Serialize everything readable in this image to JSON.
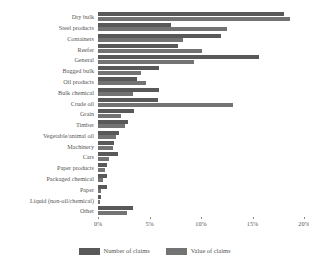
{
  "chart_data": {
    "type": "bar",
    "orientation": "horizontal",
    "title": "",
    "xlabel": "",
    "ylabel": "",
    "xlim": [
      0,
      20
    ],
    "xticks": [
      0,
      5,
      10,
      15,
      20
    ],
    "xtick_labels": [
      "0%",
      "5%",
      "10%",
      "15%",
      "20%"
    ],
    "grid": false,
    "legend_position": "bottom",
    "categories": [
      "Dry bulk",
      "Steel products",
      "Containers",
      "Reefer",
      "General",
      "Bagged bulk",
      "Oil products",
      "Bulk chemical",
      "Crude oil",
      "Grain",
      "Timber",
      "Vegetable/animal oil",
      "Machinery",
      "Cars",
      "Paper products",
      "Packaged chemical",
      "Paper",
      "Liquid (non-oil/chemical)",
      "Other"
    ],
    "series": [
      {
        "name": "Number of claims",
        "color": "#595959",
        "values": [
          18.1,
          7.1,
          11.9,
          7.8,
          15.6,
          5.9,
          3.8,
          5.9,
          5.8,
          3.5,
          2.9,
          2.0,
          1.6,
          1.9,
          0.9,
          0.9,
          0.9,
          0.3,
          3.4
        ]
      },
      {
        "name": "Value of claims",
        "color": "#737373",
        "values": [
          18.6,
          12.5,
          8.3,
          10.1,
          9.3,
          4.2,
          4.7,
          3.4,
          13.1,
          2.2,
          2.6,
          1.7,
          1.5,
          1.1,
          0.7,
          0.5,
          0.3,
          0.2,
          2.8
        ]
      }
    ]
  },
  "legend": {
    "items": [
      {
        "label": "Number of claims",
        "swatch": "number"
      },
      {
        "label": "Value of claims",
        "swatch": "value"
      }
    ]
  }
}
